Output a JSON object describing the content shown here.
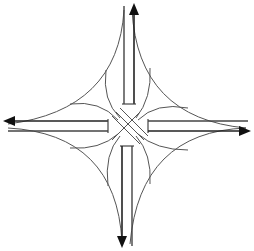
{
  "diagram": {
    "title": "",
    "colors": {
      "background": "#ffffff",
      "line": "#444444",
      "arrow": "#111111"
    },
    "arms": [
      {
        "id": "north",
        "direction": "up",
        "label": ""
      },
      {
        "id": "west",
        "direction": "left",
        "label": ""
      },
      {
        "id": "south",
        "direction": "down",
        "label": ""
      },
      {
        "id": "east",
        "direction": "right",
        "label": ""
      }
    ]
  }
}
